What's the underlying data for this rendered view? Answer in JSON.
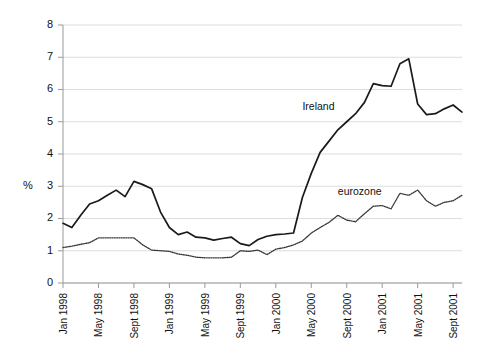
{
  "chart_data": {
    "type": "line",
    "title": "",
    "subtitle": "",
    "xlabel": "",
    "ylabel": "%",
    "ylim": [
      0,
      8
    ],
    "yticks": [
      0,
      1,
      2,
      3,
      4,
      5,
      6,
      7,
      8
    ],
    "ytick_labels": [
      "0",
      "1",
      "2",
      "3",
      "4",
      "5",
      "6",
      "7",
      "8"
    ],
    "grid": true,
    "legend_position": "inline-annotations",
    "x": [
      "Jan 1998",
      "Feb 1998",
      "Mar 1998",
      "Apr 1998",
      "May 1998",
      "Jun 1998",
      "Jul 1998",
      "Aug 1998",
      "Sept 1998",
      "Oct 1998",
      "Nov 1998",
      "Dec 1998",
      "Jan 1999",
      "Feb 1999",
      "Mar 1999",
      "Apr 1999",
      "May 1999",
      "Jun 1999",
      "Jul 1999",
      "Aug 1999",
      "Sept 1999",
      "Oct 1999",
      "Nov 1999",
      "Dec 1999",
      "Jan 2000",
      "Feb 2000",
      "Mar 2000",
      "Apr 2000",
      "May 2000",
      "Jun 2000",
      "Jul 2000",
      "Aug 2000",
      "Sept 2000",
      "Oct 2000",
      "Nov 2000",
      "Dec 2000",
      "Jan 2001",
      "Feb 2001",
      "Mar 2001",
      "Apr 2001",
      "May 2001",
      "Jun 2001",
      "Jul 2001",
      "Aug 2001",
      "Sept 2001",
      "Oct 2001"
    ],
    "xtick_labels": [
      "Jan 1998",
      "May 1998",
      "Sept 1998",
      "Jan 1999",
      "May 1999",
      "Sept 1999",
      "Jan 2000",
      "May 2000",
      "Sept 2000",
      "Jan 2001",
      "May 2001",
      "Sept 2001"
    ],
    "xtick_indices": [
      0,
      4,
      8,
      12,
      16,
      20,
      24,
      28,
      32,
      36,
      40,
      44
    ],
    "series": [
      {
        "name": "Ireland",
        "style": "solid",
        "color": "#1a1a1a",
        "label_text": "Ireland",
        "values": [
          1.85,
          1.72,
          2.1,
          2.45,
          2.55,
          2.72,
          2.88,
          2.68,
          3.15,
          3.05,
          2.92,
          2.2,
          1.72,
          1.5,
          1.58,
          1.42,
          1.4,
          1.33,
          1.38,
          1.42,
          1.22,
          1.16,
          1.35,
          1.45,
          1.5,
          1.52,
          1.55,
          2.65,
          3.4,
          4.05,
          4.4,
          4.75,
          5.0,
          5.25,
          5.6,
          6.18,
          6.12,
          6.1,
          6.8,
          6.95,
          5.55,
          5.22,
          5.25,
          5.4,
          5.52,
          5.3
        ]
      },
      {
        "name": "eurozone",
        "style": "dotted",
        "color": "#3a3a3a",
        "label_text": "eurozone",
        "values": [
          1.1,
          1.14,
          1.2,
          1.25,
          1.4,
          1.4,
          1.4,
          1.4,
          1.4,
          1.18,
          1.02,
          1.0,
          0.98,
          0.9,
          0.86,
          0.8,
          0.78,
          0.78,
          0.78,
          0.8,
          1.0,
          0.98,
          1.02,
          0.88,
          1.05,
          1.1,
          1.18,
          1.3,
          1.55,
          1.72,
          1.88,
          2.1,
          1.95,
          1.9,
          2.15,
          2.38,
          2.4,
          2.3,
          2.78,
          2.72,
          2.88,
          2.55,
          2.38,
          2.5,
          2.55,
          2.72
        ],
        "tail_values": [
          3.32,
          3.05,
          2.8,
          2.65
        ]
      }
    ],
    "annotations": [
      {
        "text": "Ireland",
        "x_index": 27,
        "y_value": 5.35
      },
      {
        "text": "eurozone",
        "x_index": 31,
        "y_value": 2.72
      }
    ]
  }
}
